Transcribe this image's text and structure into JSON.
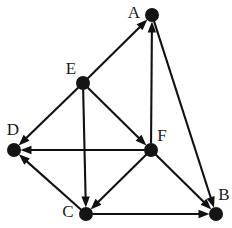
{
  "figure": {
    "kind": "directed-graph",
    "width": 232,
    "height": 228,
    "background_color": "#ffffff",
    "ink_color": "#141414",
    "edge_color": "#111111"
  },
  "nodes": [
    {
      "id": "A",
      "label": "A",
      "cx": 152,
      "cy": 15,
      "r": 7.0,
      "label_x": 134,
      "label_y": 14,
      "label_anchor": "middle"
    },
    {
      "id": "B",
      "label": "B",
      "cx": 216,
      "cy": 214,
      "r": 7.0,
      "label_x": 224,
      "label_y": 196,
      "label_anchor": "middle"
    },
    {
      "id": "C",
      "label": "C",
      "cx": 86,
      "cy": 214,
      "r": 7.0,
      "label_x": 68,
      "label_y": 213,
      "label_anchor": "middle"
    },
    {
      "id": "D",
      "label": "D",
      "cx": 14,
      "cy": 150,
      "r": 7.0,
      "label_x": 13,
      "label_y": 131,
      "label_anchor": "middle"
    },
    {
      "id": "E",
      "label": "E",
      "cx": 83,
      "cy": 83,
      "r": 7.0,
      "label_x": 71,
      "label_y": 70,
      "label_anchor": "middle"
    },
    {
      "id": "F",
      "label": "F",
      "cx": 151,
      "cy": 150,
      "r": 7.0,
      "label_x": 162,
      "label_y": 137,
      "label_anchor": "middle"
    }
  ],
  "edges": [
    {
      "from": "E",
      "to": "A",
      "directed": true
    },
    {
      "from": "F",
      "to": "A",
      "directed": true
    },
    {
      "from": "A",
      "to": "B",
      "directed": true
    },
    {
      "from": "E",
      "to": "D",
      "directed": true
    },
    {
      "from": "F",
      "to": "D",
      "directed": true
    },
    {
      "from": "C",
      "to": "D",
      "directed": true
    },
    {
      "from": "E",
      "to": "F",
      "directed": true
    },
    {
      "from": "E",
      "to": "C",
      "directed": true
    },
    {
      "from": "F",
      "to": "C",
      "directed": true
    },
    {
      "from": "F",
      "to": "B",
      "directed": true
    },
    {
      "from": "C",
      "to": "B",
      "directed": true
    }
  ],
  "arrowhead": {
    "length": 11,
    "half_width": 4.2
  }
}
